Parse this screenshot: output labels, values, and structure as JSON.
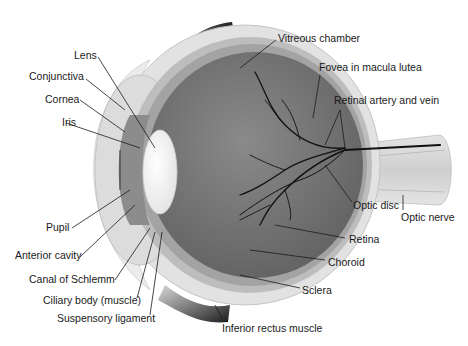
{
  "diagram": {
    "labels": {
      "lens": "Lens",
      "conjunctiva": "Conjunctiva",
      "cornea": "Cornea",
      "iris": "Iris",
      "pupil": "Pupil",
      "anterior_cavity": "Anterior cavity",
      "canal_of_schlemm": "Canal of Schlemm",
      "ciliary_body": "Ciliary body (muscle)",
      "suspensory_ligament": "Suspensory ligament",
      "vitreous_chamber": "Vitreous chamber",
      "fovea": "Fovea in macula lutea",
      "retinal_artery_vein": "Retinal artery and vein",
      "optic_nerve": "Optic nerve",
      "optic_disc": "Optic disc",
      "retina": "Retina",
      "choroid": "Choroid",
      "sclera": "Sclera",
      "inferior_rectus": "Inferior rectus muscle"
    }
  }
}
